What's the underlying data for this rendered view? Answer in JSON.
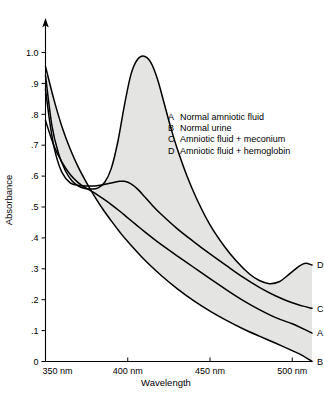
{
  "chart_data": {
    "type": "line",
    "title": "",
    "xlabel": "Wavelength",
    "ylabel": "Absorbance",
    "xlim": [
      350,
      512
    ],
    "ylim": [
      0,
      1.05
    ],
    "grid": false,
    "legend_position": "inside-upper-right",
    "x_tick_labels": [
      "350 nm",
      "400 nm",
      "450 nm",
      "500 nm"
    ],
    "x_tick_values": [
      350,
      400,
      450,
      500
    ],
    "y_tick_labels": [
      "0",
      ".1",
      ".2",
      ".3",
      ".4",
      ".5",
      ".6",
      ".7",
      ".8",
      ".9",
      "1.0"
    ],
    "y_tick_values": [
      0,
      0.1,
      0.2,
      0.3,
      0.4,
      0.5,
      0.6,
      0.7,
      0.8,
      0.9,
      1.0
    ],
    "shaded_band": {
      "fill": "#e4e4e2",
      "upper_series": "D",
      "lower_series": "B"
    },
    "series": [
      {
        "name": "A",
        "label": "Normal amniotic fluid",
        "end_label": "A",
        "color": "#000000",
        "x": [
          350,
          355,
          360,
          365,
          370,
          375,
          380,
          385,
          390,
          395,
          400,
          405,
          410,
          415,
          420,
          430,
          440,
          450,
          460,
          470,
          480,
          490,
          500,
          505,
          512
        ],
        "y": [
          0.78,
          0.7,
          0.645,
          0.605,
          0.578,
          0.56,
          0.545,
          0.527,
          0.508,
          0.487,
          0.465,
          0.443,
          0.421,
          0.4,
          0.38,
          0.342,
          0.305,
          0.268,
          0.232,
          0.198,
          0.168,
          0.142,
          0.122,
          0.11,
          0.092
        ]
      },
      {
        "name": "B",
        "label": "Normal urine",
        "end_label": "B",
        "color": "#000000",
        "x": [
          350,
          355,
          360,
          365,
          370,
          375,
          380,
          385,
          390,
          395,
          400,
          410,
          420,
          430,
          440,
          450,
          460,
          470,
          480,
          490,
          500,
          506,
          512
        ],
        "y": [
          0.955,
          0.85,
          0.76,
          0.688,
          0.628,
          0.578,
          0.533,
          0.492,
          0.455,
          0.42,
          0.388,
          0.33,
          0.28,
          0.236,
          0.197,
          0.163,
          0.133,
          0.106,
          0.082,
          0.059,
          0.035,
          0.02,
          0.0
        ]
      },
      {
        "name": "C",
        "label": "Amniotic fluid + meconium",
        "end_label": "C",
        "color": "#000000",
        "x": [
          350,
          353,
          356,
          360,
          365,
          370,
          375,
          380,
          385,
          390,
          395,
          398,
          402,
          406,
          410,
          415,
          420,
          430,
          440,
          450,
          460,
          470,
          480,
          490,
          500,
          506,
          512
        ],
        "y": [
          0.88,
          0.76,
          0.675,
          0.612,
          0.578,
          0.57,
          0.568,
          0.568,
          0.572,
          0.578,
          0.583,
          0.583,
          0.575,
          0.558,
          0.535,
          0.505,
          0.478,
          0.43,
          0.388,
          0.348,
          0.31,
          0.273,
          0.24,
          0.212,
          0.19,
          0.18,
          0.172
        ]
      },
      {
        "name": "D",
        "label": "Amniotic fluid + hemoglobin",
        "end_label": "D",
        "color": "#000000",
        "x": [
          350,
          354,
          358,
          362,
          366,
          370,
          374,
          378,
          382,
          386,
          390,
          394,
          398,
          402,
          406,
          410,
          414,
          418,
          422,
          426,
          430,
          436,
          442,
          450,
          458,
          466,
          474,
          480,
          486,
          492,
          498,
          504,
          508,
          512
        ],
        "y": [
          0.925,
          0.76,
          0.672,
          0.618,
          0.585,
          0.568,
          0.56,
          0.558,
          0.562,
          0.58,
          0.625,
          0.712,
          0.83,
          0.93,
          0.978,
          0.988,
          0.968,
          0.915,
          0.838,
          0.76,
          0.69,
          0.6,
          0.525,
          0.442,
          0.378,
          0.325,
          0.283,
          0.262,
          0.252,
          0.258,
          0.282,
          0.308,
          0.318,
          0.312
        ]
      }
    ]
  },
  "axes": {
    "y_title": "Absorbance",
    "x_title": "Wavelength",
    "y_arrow": "up-arrow"
  },
  "legend": {
    "entries": [
      {
        "key": "A",
        "text": "Normal amniotic fluid"
      },
      {
        "key": "B",
        "text": "Normal urine"
      },
      {
        "key": "C",
        "text": "Amniotic fluid  +  meconium"
      },
      {
        "key": "D",
        "text": "Amniotic fluid  +  hemoglobin"
      }
    ]
  },
  "caption": {
    "text": ""
  }
}
